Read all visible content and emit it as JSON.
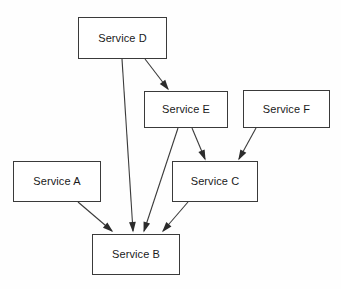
{
  "diagram": {
    "type": "directed-graph",
    "background_color": "#fefefe",
    "node_fill_color": "#ffffff",
    "node_border_color": "#3a3a3a",
    "edge_color": "#3a3a3a",
    "text_color": "#1a1a1a",
    "nodes": [
      {
        "id": "A",
        "label": "Service A",
        "x": 13,
        "y": 161,
        "w": 88,
        "h": 41
      },
      {
        "id": "B",
        "label": "Service B",
        "x": 92,
        "y": 234,
        "w": 88,
        "h": 41
      },
      {
        "id": "C",
        "label": "Service C",
        "x": 172,
        "y": 161,
        "w": 86,
        "h": 41
      },
      {
        "id": "D",
        "label": "Service D",
        "x": 78,
        "y": 17,
        "w": 89,
        "h": 42
      },
      {
        "id": "E",
        "label": "Service E",
        "x": 144,
        "y": 91,
        "w": 84,
        "h": 37
      },
      {
        "id": "F",
        "label": "Service F",
        "x": 243,
        "y": 90,
        "w": 87,
        "h": 38
      }
    ],
    "edges": [
      {
        "id": "d-e",
        "from": "D",
        "to": "E",
        "label": "",
        "x1": 145,
        "y1": 59,
        "x2": 168,
        "y2": 89
      },
      {
        "id": "d-b",
        "from": "D",
        "to": "B",
        "label": "",
        "x1": 122,
        "y1": 59,
        "x2": 133,
        "y2": 231
      },
      {
        "id": "e-c",
        "from": "E",
        "to": "C",
        "label": "",
        "x1": 192,
        "y1": 128,
        "x2": 205,
        "y2": 159
      },
      {
        "id": "e-b",
        "from": "E",
        "to": "B",
        "label": "",
        "x1": 178,
        "y1": 128,
        "x2": 144,
        "y2": 231
      },
      {
        "id": "f-c",
        "from": "F",
        "to": "C",
        "label": "",
        "x1": 256,
        "y1": 128,
        "x2": 239,
        "y2": 159
      },
      {
        "id": "a-b",
        "from": "A",
        "to": "B",
        "label": "",
        "x1": 78,
        "y1": 202,
        "x2": 112,
        "y2": 231
      },
      {
        "id": "c-b",
        "from": "C",
        "to": "B",
        "label": "",
        "x1": 188,
        "y1": 202,
        "x2": 163,
        "y2": 231
      }
    ]
  }
}
